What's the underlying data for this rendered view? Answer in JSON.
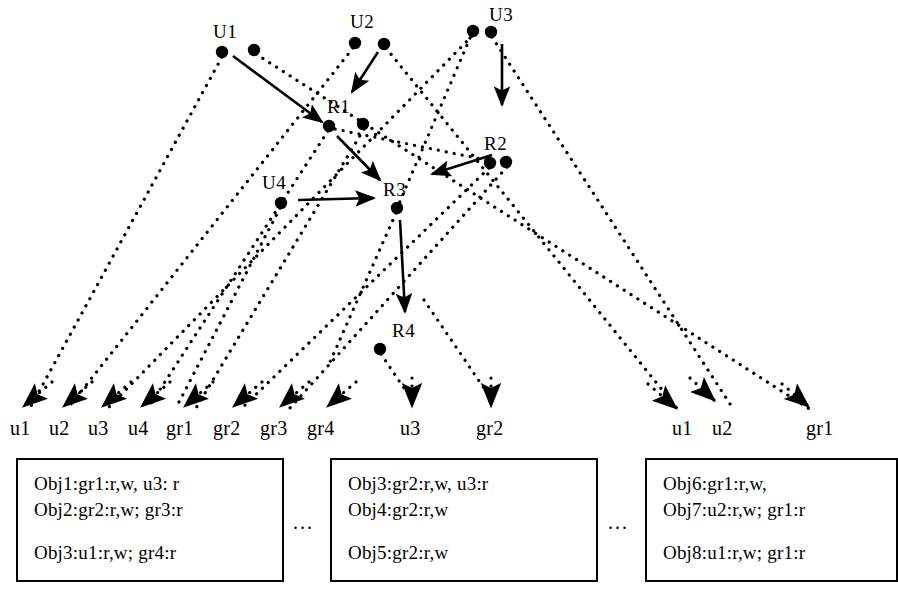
{
  "diagram": {
    "colors": {
      "ink": "#000000",
      "background": "#ffffff"
    },
    "top_nodes": [
      {
        "id": "U1",
        "label": "U1",
        "label_x": 213,
        "label_y": 22,
        "dots": [
          [
            222,
            52
          ],
          [
            254,
            50
          ]
        ]
      },
      {
        "id": "U2",
        "label": "U2",
        "label_x": 350,
        "label_y": 12,
        "dots": [
          [
            355,
            43
          ],
          [
            384,
            44
          ]
        ]
      },
      {
        "id": "U3",
        "label": "U3",
        "label_x": 489,
        "label_y": 5,
        "dots": [
          [
            473,
            31
          ],
          [
            491,
            32
          ]
        ]
      },
      {
        "id": "U4",
        "label": "U4",
        "label_x": 262,
        "label_y": 173,
        "dots": [
          [
            281,
            203
          ]
        ]
      },
      {
        "id": "R1",
        "label": "R1",
        "label_x": 327,
        "label_y": 97,
        "dots": [
          [
            329,
            126
          ],
          [
            363,
            124
          ]
        ]
      },
      {
        "id": "R2",
        "label": "R2",
        "label_x": 484,
        "label_y": 134,
        "dots": [
          [
            490,
            163
          ],
          [
            506,
            162
          ]
        ]
      },
      {
        "id": "R3",
        "label": "R3",
        "label_x": 383,
        "label_y": 180,
        "dots": [
          [
            397,
            208
          ]
        ]
      },
      {
        "id": "R4",
        "label": "R4",
        "label_x": 392,
        "label_y": 321,
        "dots": [
          [
            380,
            349
          ]
        ]
      }
    ],
    "solid_arrows": [
      {
        "name": "u1-to-r1",
        "x1": 233,
        "y1": 56,
        "x2": 322,
        "y2": 122
      },
      {
        "name": "u2-to-r1",
        "x1": 378,
        "y1": 52,
        "x2": 352,
        "y2": 92
      },
      {
        "name": "u3-to-r2",
        "x1": 502,
        "y1": 44,
        "x2": 502,
        "y2": 105
      },
      {
        "name": "r1-to-r3",
        "x1": 337,
        "y1": 136,
        "x2": 380,
        "y2": 180
      },
      {
        "name": "r2-to-left",
        "x1": 492,
        "y1": 155,
        "x2": 432,
        "y2": 174
      },
      {
        "name": "u4-to-r3",
        "x1": 298,
        "y1": 200,
        "x2": 374,
        "y2": 198
      },
      {
        "name": "r3-to-r4",
        "x1": 400,
        "y1": 220,
        "x2": 405,
        "y2": 312
      }
    ],
    "dotted_edges": [
      {
        "name": "u1-dot-to-u1sink",
        "x1": 222,
        "y1": 57,
        "x2": 30,
        "y2": 408
      },
      {
        "name": "u1b-dot-to-gr1sink",
        "x1": 256,
        "y1": 54,
        "x2": 811,
        "y2": 410
      },
      {
        "name": "u2-dot-to-u2sink",
        "x1": 353,
        "y1": 48,
        "x2": 68,
        "y2": 408
      },
      {
        "name": "u2b-dot-to-u1sink-right",
        "x1": 386,
        "y1": 48,
        "x2": 680,
        "y2": 412
      },
      {
        "name": "u3-dot-to-u3sink",
        "x1": 472,
        "y1": 36,
        "x2": 108,
        "y2": 408
      },
      {
        "name": "u3b-dot-to-u2sink-right",
        "x1": 492,
        "y1": 37,
        "x2": 730,
        "y2": 404
      },
      {
        "name": "r1-dot-down-left",
        "x1": 328,
        "y1": 131,
        "x2": 148,
        "y2": 408
      },
      {
        "name": "r1b-dot-down",
        "x1": 364,
        "y1": 129,
        "x2": 196,
        "y2": 408
      },
      {
        "name": "r2-dot-down-a",
        "x1": 489,
        "y1": 168,
        "x2": 242,
        "y2": 408
      },
      {
        "name": "r2-dot-down-b",
        "x1": 507,
        "y1": 167,
        "x2": 290,
        "y2": 408
      },
      {
        "name": "r3-dot-down",
        "x1": 396,
        "y1": 213,
        "x2": 330,
        "y2": 362
      },
      {
        "name": "r4-dot-down-u3",
        "x1": 381,
        "y1": 354,
        "x2": 412,
        "y2": 400
      },
      {
        "name": "r4b-dot-down-gr2",
        "x1": 424,
        "y1": 300,
        "x2": 492,
        "y2": 400
      },
      {
        "name": "u4-dot-down",
        "x1": 280,
        "y1": 208,
        "x2": 178,
        "y2": 404
      },
      {
        "name": "cross-r2-to-r1",
        "x1": 486,
        "y1": 160,
        "x2": 330,
        "y2": 128
      },
      {
        "name": "cross-u3-to-r3",
        "x1": 470,
        "y1": 38,
        "x2": 398,
        "y2": 206
      }
    ],
    "sink_labels": [
      {
        "name": "sink-u1",
        "text": "u1",
        "x": 10,
        "y": 418
      },
      {
        "name": "sink-u2",
        "text": "u2",
        "x": 49,
        "y": 418
      },
      {
        "name": "sink-u3",
        "text": "u3",
        "x": 88,
        "y": 418
      },
      {
        "name": "sink-u4",
        "text": "u4",
        "x": 128,
        "y": 418
      },
      {
        "name": "sink-gr1",
        "text": "gr1",
        "x": 166,
        "y": 418
      },
      {
        "name": "sink-gr2",
        "text": "gr2",
        "x": 213,
        "y": 418
      },
      {
        "name": "sink-gr3",
        "text": "gr3",
        "x": 260,
        "y": 418
      },
      {
        "name": "sink-gr4",
        "text": "gr4",
        "x": 307,
        "y": 418
      },
      {
        "name": "sink-u3-mid",
        "text": "u3",
        "x": 400,
        "y": 418
      },
      {
        "name": "sink-gr2-mid",
        "text": "gr2",
        "x": 476,
        "y": 418
      },
      {
        "name": "sink-u1-right",
        "text": "u1",
        "x": 672,
        "y": 418
      },
      {
        "name": "sink-u2-right",
        "text": "u2",
        "x": 712,
        "y": 418
      },
      {
        "name": "sink-gr1-right",
        "text": "gr1",
        "x": 806,
        "y": 418
      }
    ],
    "sink_arrow_tips": [
      {
        "name": "tip-u1",
        "x1": 52,
        "y1": 382,
        "x2": 24,
        "y2": 406,
        "dir": "down-left"
      },
      {
        "name": "tip-u2",
        "x1": 92,
        "y1": 382,
        "x2": 64,
        "y2": 406,
        "dir": "down-left"
      },
      {
        "name": "tip-u3",
        "x1": 131,
        "y1": 382,
        "x2": 103,
        "y2": 406,
        "dir": "down-left"
      },
      {
        "name": "tip-u4",
        "x1": 170,
        "y1": 382,
        "x2": 142,
        "y2": 406,
        "dir": "down-left"
      },
      {
        "name": "tip-gr1",
        "x1": 213,
        "y1": 382,
        "x2": 185,
        "y2": 406,
        "dir": "down-left"
      },
      {
        "name": "tip-gr2",
        "x1": 262,
        "y1": 382,
        "x2": 234,
        "y2": 406,
        "dir": "down-left"
      },
      {
        "name": "tip-gr3",
        "x1": 309,
        "y1": 382,
        "x2": 281,
        "y2": 406,
        "dir": "down-left"
      },
      {
        "name": "tip-gr4",
        "x1": 356,
        "y1": 382,
        "x2": 328,
        "y2": 406,
        "dir": "down-left"
      },
      {
        "name": "tip-u3-mid",
        "x1": 412,
        "y1": 378,
        "x2": 412,
        "y2": 406,
        "dir": "down"
      },
      {
        "name": "tip-gr2-mid",
        "x1": 491,
        "y1": 378,
        "x2": 491,
        "y2": 406,
        "dir": "down"
      },
      {
        "name": "tip-u1-right",
        "x1": 648,
        "y1": 384,
        "x2": 676,
        "y2": 408,
        "dir": "down-right"
      },
      {
        "name": "tip-u2-right",
        "x1": 690,
        "y1": 378,
        "x2": 714,
        "y2": 400,
        "dir": "down-right"
      },
      {
        "name": "tip-gr1-right",
        "x1": 782,
        "y1": 384,
        "x2": 808,
        "y2": 406,
        "dir": "down-right"
      }
    ],
    "boxes": [
      {
        "name": "obj-box-1",
        "x": 16,
        "y": 458,
        "w": 268,
        "h": 124,
        "lines": [
          {
            "text": "Obj1:gr1:r,w, u3: r",
            "dy": 14
          },
          {
            "text": "Obj2:gr2:r,w; gr3:r",
            "dy": 40
          },
          {
            "text": "Obj3:u1:r,w; gr4:r",
            "dy": 83
          }
        ]
      },
      {
        "name": "obj-box-2",
        "x": 330,
        "y": 458,
        "w": 268,
        "h": 124,
        "lines": [
          {
            "text": "Obj3:gr2:r,w, u3:r",
            "dy": 14
          },
          {
            "text": "Obj4:gr2:r,w",
            "dy": 40
          },
          {
            "text": "Obj5:gr2:r,w",
            "dy": 83
          }
        ]
      },
      {
        "name": "obj-box-3",
        "x": 645,
        "y": 458,
        "w": 253,
        "h": 124,
        "lines": [
          {
            "text": "Obj6:gr1:r,w,",
            "dy": 14
          },
          {
            "text": "Obj7:u2:r,w; gr1:r",
            "dy": 40
          },
          {
            "text": "Obj8:u1:r,w; gr1:r",
            "dy": 83
          }
        ]
      }
    ],
    "ellipses": [
      {
        "name": "ellipsis-1",
        "text": "...",
        "x": 293,
        "y": 512
      },
      {
        "name": "ellipsis-2",
        "text": "...",
        "x": 608,
        "y": 512
      }
    ]
  }
}
